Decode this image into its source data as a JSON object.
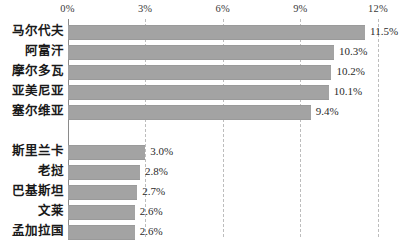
{
  "chart_data": {
    "type": "bar",
    "orientation": "horizontal",
    "title": "",
    "subtitle": "",
    "xlabel": "",
    "ylabel": "",
    "xlim": [
      0,
      12
    ],
    "grid": true,
    "legend": null,
    "axis_position": "top",
    "value_suffix": "%",
    "tick_labels": [
      "0%",
      "3%",
      "6%",
      "9%",
      "12%"
    ],
    "ticks": [
      0,
      3,
      6,
      9,
      12
    ],
    "categories": [
      "马尔代夫",
      "阿富汗",
      "摩尔多瓦",
      "亚美尼亚",
      "塞尔维亚",
      "斯里兰卡",
      "老挝",
      "巴基斯坦",
      "文莱",
      "孟加拉国"
    ],
    "values": [
      11.5,
      10.3,
      10.2,
      10.1,
      9.4,
      3.0,
      2.8,
      2.7,
      2.6,
      2.6
    ],
    "value_labels": [
      "11.5%",
      "10.3%",
      "10.2%",
      "10.1%",
      "9.4%",
      "3.0%",
      "2.8%",
      "2.7%",
      "2.6%",
      "2.6%"
    ],
    "group_break_after_index": 4,
    "colors": {
      "bar": "#a3a3a3",
      "gridline": "#bdbdbd",
      "axis": "#8a8a8a",
      "text": "#1a1a1a",
      "background": "#ffffff"
    }
  }
}
